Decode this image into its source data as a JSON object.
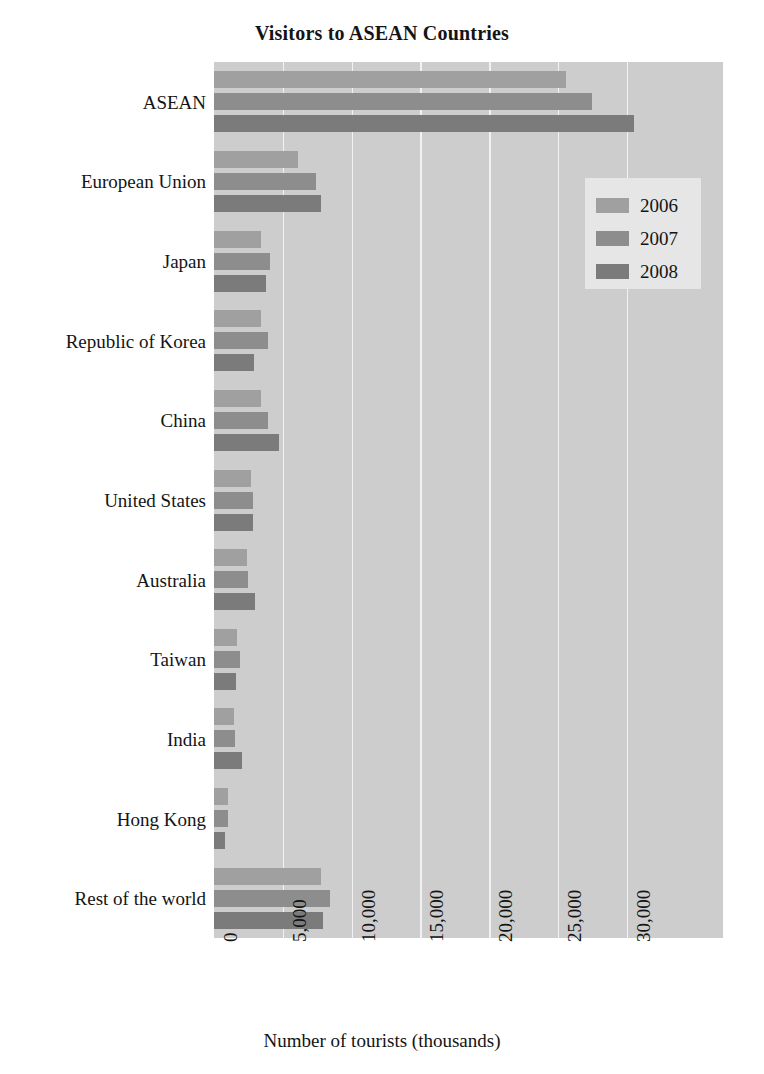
{
  "chart_data": {
    "type": "bar",
    "orientation": "horizontal",
    "title": "Visitors to ASEAN Countries",
    "xlabel": "Number of tourists (thousands)",
    "ylabel": "",
    "xlim": [
      0,
      37000
    ],
    "xticks": [
      0,
      5000,
      10000,
      15000,
      20000,
      25000,
      30000
    ],
    "xticklabels": [
      "0",
      "5,000",
      "10,000",
      "15,000",
      "20,000",
      "25,000",
      "30,000"
    ],
    "grid": "vertical",
    "legend_position": "upper right",
    "categories": [
      "ASEAN",
      "European Union",
      "Japan",
      "Republic of Korea",
      "China",
      "United States",
      "Australia",
      "Taiwan",
      "India",
      "Hong Kong",
      "Rest of the world"
    ],
    "series": [
      {
        "name": "2006",
        "color": "#a0a0a0",
        "values": [
          25600,
          6100,
          3450,
          3450,
          3450,
          2700,
          2400,
          1700,
          1450,
          1000,
          7750
        ]
      },
      {
        "name": "2007",
        "color": "#8d8d8d",
        "values": [
          27450,
          7400,
          4100,
          3950,
          3950,
          2800,
          2500,
          1900,
          1500,
          1000,
          8450
        ]
      },
      {
        "name": "2008",
        "color": "#7b7b7b",
        "values": [
          30500,
          7750,
          3800,
          2900,
          4700,
          2800,
          3000,
          1600,
          2000,
          800,
          7950
        ]
      }
    ]
  },
  "legend": {
    "entries": [
      {
        "label": "2006"
      },
      {
        "label": "2007"
      },
      {
        "label": "2008"
      }
    ]
  },
  "colors": {
    "plot_background": "#cdcdcd",
    "gridline": "#f2f2f2",
    "legend_background": "#e6e6e6",
    "text": "#141414",
    "page_background": "#ffffff"
  }
}
